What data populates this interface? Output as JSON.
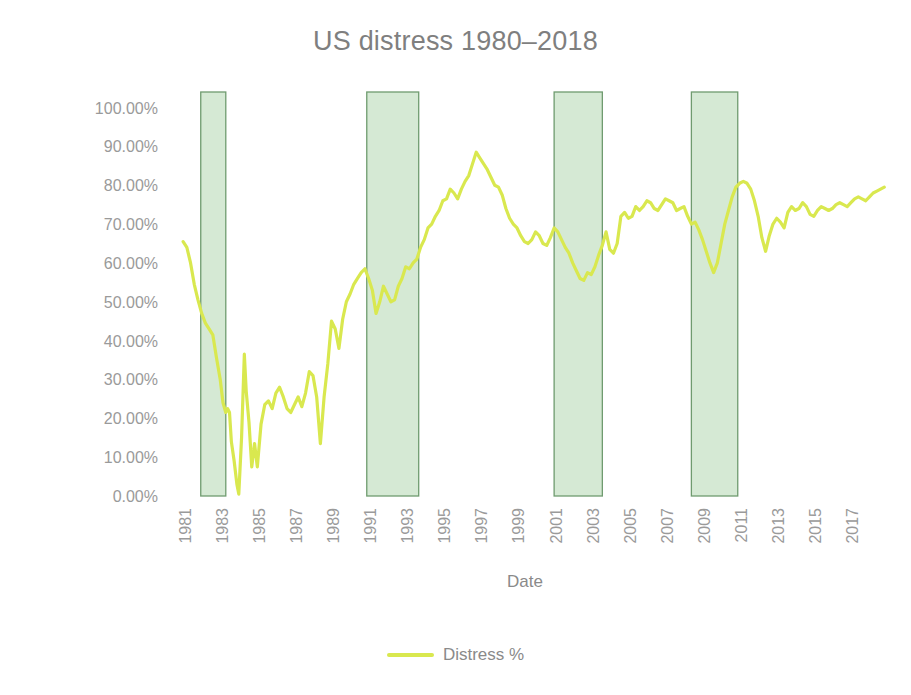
{
  "chart_data": {
    "type": "line",
    "title": "US distress 1980–2018",
    "xlabel": "Date",
    "ylabel": "Distress %",
    "legend": [
      {
        "name": "Distress %",
        "color": "#d9e84f"
      }
    ],
    "legend_position": "bottom",
    "grid": false,
    "xlim": [
      1980.0,
      2018.6
    ],
    "ylim": [
      0,
      1.04
    ],
    "ytick_labels": [
      "100.00%",
      "90.00%",
      "80.00%",
      "70.00%",
      "60.00%",
      "50.00%",
      "40.00%",
      "30.00%",
      "20.00%",
      "10.00%",
      "0.00%"
    ],
    "ytick_values": [
      1.0,
      0.9,
      0.8,
      0.7,
      0.6,
      0.5,
      0.4,
      0.3,
      0.2,
      0.1,
      0.0
    ],
    "xtick_labels": [
      "1981",
      "1983",
      "1985",
      "1987",
      "1989",
      "1991",
      "1993",
      "1995",
      "1997",
      "1999",
      "2001",
      "2003",
      "2005",
      "2007",
      "2009",
      "2011",
      "2013",
      "2015",
      "2017"
    ],
    "xtick_values": [
      1981,
      1983,
      1985,
      1987,
      1989,
      1991,
      1993,
      1995,
      1997,
      1999,
      2001,
      2003,
      2005,
      2007,
      2009,
      2011,
      2013,
      2015,
      2017
    ],
    "shaded_bands": {
      "label": "recession-band",
      "fill": "#d5e9d4",
      "stroke": "#6f9b6f",
      "ranges": [
        [
          1981.55,
          1982.9
        ],
        [
          1990.5,
          1993.3
        ],
        [
          2000.6,
          2003.2
        ],
        [
          2008.0,
          2010.5
        ]
      ]
    },
    "series": [
      {
        "name": "Distress %",
        "color": "#d9e84f",
        "x": [
          1980.6,
          1980.8,
          1981.0,
          1981.2,
          1981.4,
          1981.6,
          1981.8,
          1982.0,
          1982.2,
          1982.4,
          1982.6,
          1982.75,
          1982.9,
          1983.0,
          1983.1,
          1983.2,
          1983.35,
          1983.5,
          1983.6,
          1983.75,
          1983.9,
          1984.0,
          1984.15,
          1984.3,
          1984.45,
          1984.6,
          1984.8,
          1985.0,
          1985.2,
          1985.4,
          1985.6,
          1985.8,
          1986.0,
          1986.2,
          1986.4,
          1986.6,
          1986.8,
          1987.0,
          1987.2,
          1987.4,
          1987.6,
          1987.8,
          1988.0,
          1988.2,
          1988.4,
          1988.6,
          1988.8,
          1989.0,
          1989.2,
          1989.4,
          1989.6,
          1989.8,
          1990.0,
          1990.2,
          1990.4,
          1990.6,
          1990.8,
          1991.0,
          1991.2,
          1991.4,
          1991.6,
          1991.8,
          1992.0,
          1992.2,
          1992.4,
          1992.6,
          1992.8,
          1993.0,
          1993.2,
          1993.4,
          1993.6,
          1993.8,
          1994.0,
          1994.2,
          1994.4,
          1994.6,
          1994.8,
          1995.0,
          1995.2,
          1995.4,
          1995.6,
          1995.8,
          1996.0,
          1996.2,
          1996.4,
          1996.6,
          1996.8,
          1997.0,
          1997.2,
          1997.4,
          1997.6,
          1997.8,
          1998.0,
          1998.2,
          1998.4,
          1998.6,
          1998.8,
          1999.0,
          1999.2,
          1999.4,
          1999.6,
          1999.8,
          2000.0,
          2000.2,
          2000.4,
          2000.6,
          2000.8,
          2001.0,
          2001.2,
          2001.4,
          2001.6,
          2001.8,
          2002.0,
          2002.2,
          2002.4,
          2002.6,
          2002.8,
          2003.0,
          2003.2,
          2003.4,
          2003.6,
          2003.8,
          2004.0,
          2004.2,
          2004.4,
          2004.6,
          2004.8,
          2005.0,
          2005.2,
          2005.4,
          2005.6,
          2005.8,
          2006.0,
          2006.2,
          2006.4,
          2006.6,
          2006.8,
          2007.0,
          2007.2,
          2007.4,
          2007.6,
          2007.8,
          2008.0,
          2008.2,
          2008.4,
          2008.6,
          2008.8,
          2009.0,
          2009.2,
          2009.4,
          2009.6,
          2009.8,
          2010.0,
          2010.2,
          2010.4,
          2010.6,
          2010.8,
          2011.0,
          2011.2,
          2011.4,
          2011.6,
          2011.8,
          2012.0,
          2012.2,
          2012.4,
          2012.6,
          2012.8,
          2013.0,
          2013.2,
          2013.4,
          2013.6,
          2013.8,
          2014.0,
          2014.2,
          2014.4,
          2014.6,
          2014.8,
          2015.0,
          2015.2,
          2015.4,
          2015.6,
          2015.8,
          2016.0,
          2016.2,
          2016.4,
          2016.6,
          2016.8,
          2017.0,
          2017.2,
          2017.4,
          2017.6,
          2017.8,
          2018.0,
          2018.2,
          2018.4
        ],
        "y": [
          0.655,
          0.64,
          0.6,
          0.545,
          0.505,
          0.47,
          0.445,
          0.43,
          0.415,
          0.355,
          0.3,
          0.24,
          0.215,
          0.225,
          0.215,
          0.14,
          0.09,
          0.03,
          0.005,
          0.15,
          0.365,
          0.27,
          0.19,
          0.075,
          0.135,
          0.075,
          0.185,
          0.235,
          0.245,
          0.225,
          0.265,
          0.28,
          0.255,
          0.225,
          0.215,
          0.235,
          0.255,
          0.23,
          0.265,
          0.32,
          0.31,
          0.255,
          0.135,
          0.255,
          0.34,
          0.45,
          0.43,
          0.38,
          0.455,
          0.5,
          0.52,
          0.545,
          0.56,
          0.575,
          0.585,
          0.56,
          0.53,
          0.47,
          0.5,
          0.54,
          0.52,
          0.5,
          0.505,
          0.54,
          0.56,
          0.59,
          0.585,
          0.6,
          0.61,
          0.64,
          0.66,
          0.69,
          0.7,
          0.72,
          0.735,
          0.76,
          0.765,
          0.79,
          0.78,
          0.765,
          0.79,
          0.81,
          0.825,
          0.855,
          0.885,
          0.87,
          0.855,
          0.84,
          0.82,
          0.8,
          0.795,
          0.775,
          0.74,
          0.715,
          0.7,
          0.69,
          0.67,
          0.655,
          0.65,
          0.66,
          0.68,
          0.67,
          0.65,
          0.645,
          0.665,
          0.69,
          0.68,
          0.66,
          0.64,
          0.625,
          0.6,
          0.58,
          0.56,
          0.555,
          0.575,
          0.57,
          0.59,
          0.62,
          0.645,
          0.68,
          0.635,
          0.625,
          0.65,
          0.72,
          0.73,
          0.715,
          0.72,
          0.745,
          0.735,
          0.745,
          0.76,
          0.755,
          0.74,
          0.735,
          0.75,
          0.765,
          0.76,
          0.755,
          0.735,
          0.74,
          0.745,
          0.72,
          0.7,
          0.705,
          0.685,
          0.66,
          0.63,
          0.6,
          0.575,
          0.6,
          0.65,
          0.7,
          0.735,
          0.77,
          0.795,
          0.805,
          0.81,
          0.805,
          0.79,
          0.76,
          0.72,
          0.665,
          0.63,
          0.67,
          0.7,
          0.715,
          0.705,
          0.69,
          0.73,
          0.745,
          0.735,
          0.74,
          0.755,
          0.745,
          0.725,
          0.72,
          0.735,
          0.745,
          0.74,
          0.735,
          0.74,
          0.75,
          0.755,
          0.75,
          0.745,
          0.755,
          0.765,
          0.77,
          0.765,
          0.76,
          0.77,
          0.78,
          0.785,
          0.79,
          0.795
        ]
      }
    ]
  },
  "plot_geometry": {
    "left": 172,
    "right": 888,
    "top": 92,
    "bottom": 496
  }
}
